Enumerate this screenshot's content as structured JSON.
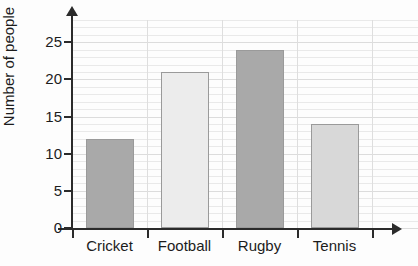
{
  "chart_data": {
    "type": "bar",
    "title": "",
    "xlabel": "",
    "ylabel": "Number of people",
    "categories": [
      "Cricket",
      "Football",
      "Rugby",
      "Tennis"
    ],
    "values": [
      12,
      21,
      24,
      14
    ],
    "bar_colors": [
      "#a9a9a9",
      "#ececec",
      "#a9a9a9",
      "#d8d8d8"
    ],
    "bar_border_color": "#9a9a9a",
    "ylim": [
      0,
      28
    ],
    "ytick_labels": [
      "0",
      "5",
      "10",
      "15",
      "20",
      "25"
    ],
    "ytick_values": [
      0,
      5,
      10,
      15,
      20,
      25
    ],
    "gridlines": {
      "horizontal": true,
      "minor_step": 1,
      "major_step": 5,
      "vertical_category_separators": true
    },
    "legend": null,
    "axis_arrows": {
      "x": true,
      "y": true
    },
    "axis_color": "#2b2b2b"
  }
}
